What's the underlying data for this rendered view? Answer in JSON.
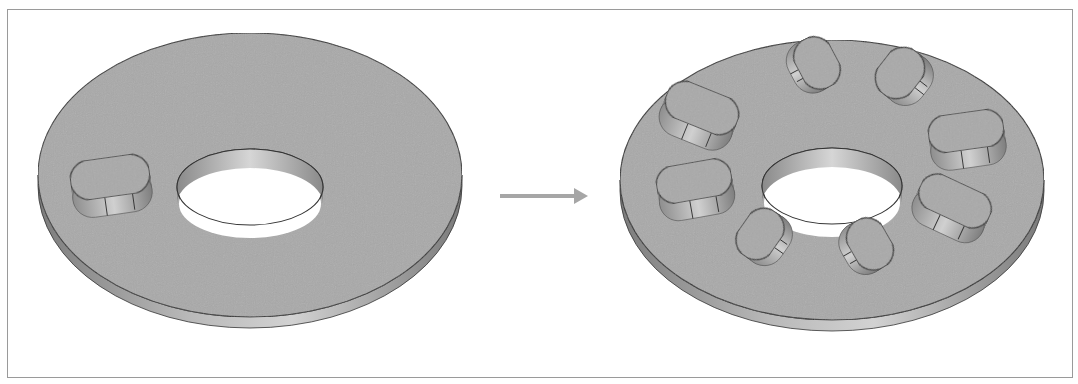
{
  "figure": {
    "description": "CAD circular pattern operation: single boss feature on a flat washer is patterned into 8 instances around the central hole",
    "colors": {
      "face": "#a9a9a9",
      "side": "#8f8f8f",
      "side_light": "#c8c8c8",
      "edge": "#333333",
      "arrow": "#a6a6a6",
      "frame": "#9a9a9a",
      "background": "#ffffff"
    }
  },
  "before_part": {
    "label": "original part",
    "disc": {
      "cx": 250,
      "cy": 175,
      "rx": 212,
      "ry": 142,
      "thickness": 11
    },
    "hole": {
      "cx": 250,
      "cy": 187,
      "rx": 73,
      "ry": 38
    },
    "bosses": [
      {
        "cx": 110,
        "cy": 186,
        "rx": 40,
        "ry": 20,
        "angle": -8,
        "height": 18
      }
    ]
  },
  "arrow": {
    "x1": 500,
    "x2": 588,
    "y": 196
  },
  "after_part": {
    "label": "patterned part",
    "disc": {
      "cx": 832,
      "cy": 180,
      "rx": 212,
      "ry": 140,
      "thickness": 11
    },
    "hole": {
      "cx": 832,
      "cy": 186,
      "rx": 70,
      "ry": 38
    },
    "boss_count": 8,
    "bosses": [
      {
        "cx": 817,
        "cy": 72,
        "rx": 27,
        "ry": 20,
        "angle": 62,
        "height": 18
      },
      {
        "cx": 900,
        "cy": 82,
        "rx": 27,
        "ry": 21,
        "angle": -52,
        "height": 18
      },
      {
        "cx": 702,
        "cy": 117,
        "rx": 38,
        "ry": 20,
        "angle": 22,
        "height": 18
      },
      {
        "cx": 966,
        "cy": 140,
        "rx": 38,
        "ry": 19,
        "angle": -8,
        "height": 18
      },
      {
        "cx": 694,
        "cy": 190,
        "rx": 38,
        "ry": 19,
        "angle": -10,
        "height": 18
      },
      {
        "cx": 955,
        "cy": 210,
        "rx": 38,
        "ry": 19,
        "angle": 25,
        "height": 18
      },
      {
        "cx": 760,
        "cy": 243,
        "rx": 27,
        "ry": 20,
        "angle": -55,
        "height": 18
      },
      {
        "cx": 870,
        "cy": 253,
        "rx": 27,
        "ry": 20,
        "angle": 60,
        "height": 18
      }
    ]
  }
}
